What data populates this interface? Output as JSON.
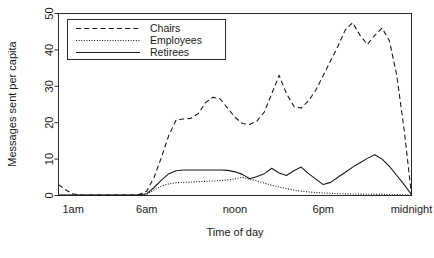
{
  "chart_data": {
    "type": "line",
    "title": "",
    "xlabel": "Time of day",
    "ylabel": "Messages sent per capita",
    "xlim": [
      0,
      24
    ],
    "ylim": [
      0,
      50
    ],
    "grid": false,
    "legend_position": "top-left",
    "ytick_values": [
      0,
      10,
      20,
      30,
      40,
      50
    ],
    "ytick_labels": [
      "0",
      "10",
      "20",
      "30",
      "40",
      "50"
    ],
    "xtick_values": [
      1,
      6,
      12,
      18,
      24
    ],
    "xtick_labels": [
      "1am",
      "6am",
      "noon",
      "6pm",
      "midnight"
    ],
    "x": [
      0,
      0.5,
      1,
      1.5,
      2,
      3,
      4,
      5,
      5.5,
      6,
      6.5,
      7,
      7.5,
      8,
      8.5,
      9,
      9.5,
      10,
      10.5,
      11,
      11.5,
      12,
      12.5,
      13,
      13.5,
      14,
      14.5,
      15,
      15.5,
      16,
      16.5,
      17,
      17.5,
      18,
      18.5,
      19,
      19.5,
      20,
      20.5,
      21,
      21.5,
      22,
      22.5,
      23,
      23.5,
      24
    ],
    "series": [
      {
        "name": "Chairs",
        "style": "dashed",
        "color": "#1a1a1a",
        "values": [
          3.0,
          1.5,
          0.4,
          0.2,
          0.1,
          0.1,
          0.1,
          0.1,
          0.3,
          1.2,
          5.0,
          10.5,
          16.5,
          20.8,
          21.0,
          21.2,
          22.5,
          25.5,
          27.0,
          26.5,
          24.0,
          21.5,
          19.8,
          19.5,
          20.5,
          23.0,
          28.0,
          33.0,
          28.0,
          24.5,
          24.0,
          26.0,
          29.0,
          33.0,
          37.0,
          41.0,
          45.5,
          47.5,
          44.0,
          41.5,
          44.0,
          46.0,
          42.5,
          33.0,
          18.0,
          0.3
        ]
      },
      {
        "name": "Employees",
        "style": "dotted",
        "color": "#1a1a1a",
        "values": [
          0.1,
          0.1,
          0.1,
          0.1,
          0.1,
          0.1,
          0.1,
          0.1,
          0.1,
          0.3,
          1.5,
          2.6,
          3.2,
          3.5,
          3.6,
          3.7,
          3.8,
          3.9,
          4.0,
          4.1,
          4.3,
          4.6,
          5.0,
          4.5,
          4.0,
          3.4,
          2.8,
          2.3,
          1.9,
          1.5,
          1.2,
          1.0,
          0.8,
          0.7,
          0.6,
          0.5,
          0.45,
          0.4,
          0.38,
          0.35,
          0.32,
          0.3,
          0.28,
          0.25,
          0.2,
          0.1
        ]
      },
      {
        "name": "Retirees",
        "style": "solid",
        "color": "#1a1a1a",
        "values": [
          0.1,
          0.1,
          0.1,
          0.1,
          0.1,
          0.1,
          0.1,
          0.1,
          0.2,
          0.5,
          2.2,
          4.2,
          6.0,
          6.8,
          7.0,
          7.0,
          7.0,
          7.0,
          7.0,
          7.0,
          6.9,
          6.5,
          5.8,
          4.6,
          5.2,
          6.0,
          7.5,
          6.2,
          5.5,
          6.8,
          7.8,
          6.0,
          4.5,
          3.0,
          3.6,
          5.0,
          6.4,
          7.8,
          9.0,
          10.2,
          11.2,
          10.0,
          8.0,
          5.5,
          3.0,
          0.2
        ]
      }
    ]
  },
  "legend": {
    "entries": [
      {
        "label": "Chairs",
        "style": "dashed"
      },
      {
        "label": "Employees",
        "style": "dotted"
      },
      {
        "label": "Retirees",
        "style": "solid"
      }
    ]
  }
}
